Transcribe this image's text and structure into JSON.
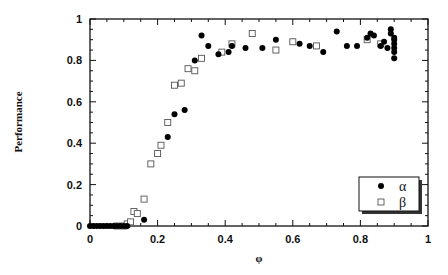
{
  "chart_data": {
    "type": "scatter",
    "title": "",
    "xlabel": "φ",
    "ylabel": "Performance",
    "xlim": [
      0,
      1
    ],
    "ylim": [
      0,
      1
    ],
    "x_ticks": [
      "0",
      "0.2",
      "0.4",
      "0.6",
      "0.8",
      "1"
    ],
    "y_ticks": [
      "0",
      "0.2",
      "0.4",
      "0.6",
      "0.8",
      "1"
    ],
    "grid": false,
    "legend_position": "lower right",
    "series": [
      {
        "name": "α",
        "marker": "filled-circle",
        "color": "#000000",
        "points": [
          [
            0.0,
            0.0
          ],
          [
            0.01,
            0.0
          ],
          [
            0.02,
            0.0
          ],
          [
            0.03,
            0.0
          ],
          [
            0.04,
            0.0
          ],
          [
            0.05,
            0.0
          ],
          [
            0.06,
            0.0
          ],
          [
            0.07,
            0.0
          ],
          [
            0.08,
            0.0
          ],
          [
            0.09,
            0.0
          ],
          [
            0.1,
            0.0
          ],
          [
            0.11,
            0.0
          ],
          [
            0.16,
            0.03
          ],
          [
            0.23,
            0.43
          ],
          [
            0.25,
            0.54
          ],
          [
            0.28,
            0.56
          ],
          [
            0.31,
            0.8
          ],
          [
            0.33,
            0.92
          ],
          [
            0.35,
            0.87
          ],
          [
            0.38,
            0.83
          ],
          [
            0.41,
            0.84
          ],
          [
            0.42,
            0.87
          ],
          [
            0.46,
            0.86
          ],
          [
            0.51,
            0.86
          ],
          [
            0.55,
            0.9
          ],
          [
            0.62,
            0.88
          ],
          [
            0.65,
            0.87
          ],
          [
            0.69,
            0.84
          ],
          [
            0.73,
            0.94
          ],
          [
            0.76,
            0.87
          ],
          [
            0.79,
            0.87
          ],
          [
            0.82,
            0.91
          ],
          [
            0.83,
            0.93
          ],
          [
            0.84,
            0.92
          ],
          [
            0.86,
            0.87
          ],
          [
            0.87,
            0.89
          ],
          [
            0.88,
            0.86
          ],
          [
            0.89,
            0.95
          ],
          [
            0.89,
            0.93
          ],
          [
            0.9,
            0.91
          ],
          [
            0.9,
            0.9
          ],
          [
            0.9,
            0.88
          ],
          [
            0.9,
            0.86
          ],
          [
            0.9,
            0.84
          ],
          [
            0.9,
            0.81
          ]
        ]
      },
      {
        "name": "β",
        "marker": "open-square",
        "color": "#555555",
        "points": [
          [
            0.08,
            0.0
          ],
          [
            0.1,
            0.0
          ],
          [
            0.11,
            0.01
          ],
          [
            0.12,
            0.02
          ],
          [
            0.13,
            0.07
          ],
          [
            0.14,
            0.06
          ],
          [
            0.16,
            0.13
          ],
          [
            0.18,
            0.3
          ],
          [
            0.2,
            0.35
          ],
          [
            0.21,
            0.39
          ],
          [
            0.23,
            0.5
          ],
          [
            0.25,
            0.68
          ],
          [
            0.27,
            0.69
          ],
          [
            0.29,
            0.76
          ],
          [
            0.31,
            0.75
          ],
          [
            0.33,
            0.81
          ],
          [
            0.39,
            0.84
          ],
          [
            0.42,
            0.88
          ],
          [
            0.48,
            0.93
          ],
          [
            0.55,
            0.85
          ],
          [
            0.6,
            0.89
          ],
          [
            0.67,
            0.87
          ],
          [
            0.82,
            0.9
          ],
          [
            0.86,
            0.88
          ]
        ]
      }
    ]
  },
  "legend": {
    "items": [
      {
        "label": "α",
        "marker": "filled-circle"
      },
      {
        "label": "β",
        "marker": "open-square"
      }
    ]
  },
  "axes": {
    "x_title": "φ",
    "y_title": "Performance"
  }
}
